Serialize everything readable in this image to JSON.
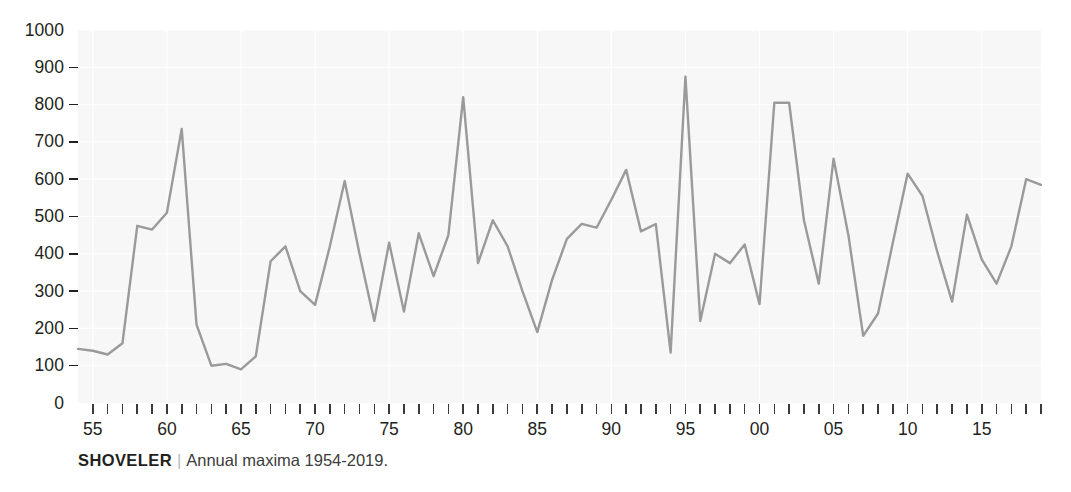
{
  "caption": {
    "title": "SHOVELER",
    "separator": "|",
    "subtitle": "Annual maxima 1954-2019."
  },
  "axes": {
    "y_ticks": [
      0,
      100,
      200,
      300,
      400,
      500,
      600,
      700,
      800,
      900,
      1000
    ],
    "x_tick_labels": [
      "55",
      "60",
      "65",
      "70",
      "75",
      "80",
      "85",
      "90",
      "95",
      "00",
      "05",
      "10",
      "15"
    ],
    "x_tick_years": [
      1955,
      1960,
      1965,
      1970,
      1975,
      1980,
      1985,
      1990,
      1995,
      2000,
      2005,
      2010,
      2015
    ]
  },
  "style": {
    "line_color": "#9a9a9a",
    "plot_background": "#f6f6f6",
    "grid_color": "#ffffff",
    "text_color": "#231f20"
  },
  "chart_data": {
    "type": "line",
    "title": "SHOVELER",
    "subtitle": "Annual maxima 1954-2019.",
    "xlabel": "",
    "ylabel": "",
    "xlim": [
      1954,
      2019
    ],
    "ylim": [
      0,
      1000
    ],
    "grid": true,
    "legend": null,
    "x": [
      1954,
      1955,
      1956,
      1957,
      1958,
      1959,
      1960,
      1961,
      1962,
      1963,
      1964,
      1965,
      1966,
      1967,
      1968,
      1969,
      1970,
      1971,
      1972,
      1973,
      1974,
      1975,
      1976,
      1977,
      1978,
      1979,
      1980,
      1981,
      1982,
      1983,
      1984,
      1985,
      1986,
      1987,
      1988,
      1989,
      1990,
      1991,
      1992,
      1993,
      1994,
      1995,
      1996,
      1997,
      1998,
      1999,
      2000,
      2001,
      2002,
      2003,
      2004,
      2005,
      2006,
      2007,
      2008,
      2009,
      2010,
      2011,
      2012,
      2013,
      2014,
      2015,
      2016,
      2017,
      2018,
      2019
    ],
    "values": [
      145,
      140,
      130,
      160,
      475,
      465,
      510,
      735,
      210,
      100,
      105,
      90,
      125,
      380,
      420,
      300,
      263,
      420,
      595,
      400,
      220,
      430,
      245,
      455,
      340,
      450,
      820,
      375,
      490,
      420,
      300,
      190,
      330,
      440,
      480,
      470,
      545,
      625,
      460,
      480,
      135,
      875,
      220,
      400,
      375,
      425,
      265,
      805,
      805,
      490,
      320,
      655,
      450,
      180,
      240,
      430,
      615,
      555,
      405,
      272,
      505,
      385,
      320,
      420,
      600,
      585
    ],
    "units": "count"
  }
}
